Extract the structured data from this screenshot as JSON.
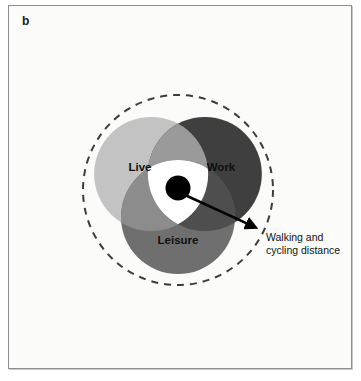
{
  "figure": {
    "panel_label": "b",
    "background_color": "#fbfbf9",
    "border_color": "#8e8e8e",
    "width": 361,
    "height": 381
  },
  "diagram": {
    "type": "venn-three-circle",
    "center": {
      "x": 178,
      "y": 190
    },
    "circle_radius": 57,
    "circle_offset": 31,
    "boundary": {
      "name": "walking-and-cycling-distance-boundary",
      "style": "dashed",
      "radius": 95,
      "color": "#3c3c3c",
      "dash_pattern": "7 6",
      "stroke_width": 2
    },
    "sets": [
      {
        "id": "live",
        "label": "Live",
        "color": "#c3c3c3",
        "label_x": 140,
        "label_y": 168,
        "center_x": 151,
        "center_y": 169
      },
      {
        "id": "work",
        "label": "Work",
        "color": "#3f3f3f",
        "label_x": 221,
        "label_y": 168,
        "center_x": 205,
        "center_y": 169
      },
      {
        "id": "leisure",
        "label": "Leisure",
        "color": "#6f6f6f",
        "label_x": 178,
        "label_y": 241,
        "center_x": 178,
        "center_y": 216
      }
    ],
    "overlaps": [
      {
        "id": "live-work",
        "color": "#9a9a9a"
      },
      {
        "id": "live-leisure",
        "color": "#8c8c8c"
      },
      {
        "id": "work-leisure",
        "color": "#4e4e4e"
      }
    ],
    "core": {
      "id": "live-work-leisure-core",
      "color": "#ffffff",
      "description": "white central intersection"
    },
    "hub": {
      "id": "hub-dot",
      "color": "#000000",
      "x": 178,
      "y": 188,
      "radius": 12.5
    },
    "arrow": {
      "id": "distance-arrow",
      "color": "#000000",
      "from_x": 185,
      "from_y": 195,
      "to_x": 259,
      "to_y": 229,
      "stroke_width": 2.6
    }
  },
  "annotation": {
    "name": "walking-and-cycling-distance-label",
    "line1": "Walking and",
    "line2": "cycling distance",
    "x": 266,
    "y": 238
  }
}
